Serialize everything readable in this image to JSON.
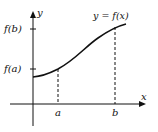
{
  "diagram": {
    "curve_label": "y = f(x)",
    "axes": {
      "x_label": "x",
      "y_label": "y"
    },
    "y_ticks": [
      {
        "label": "f(b)"
      },
      {
        "label": "f(a)"
      }
    ],
    "x_ticks": [
      {
        "label": "a"
      },
      {
        "label": "b"
      }
    ],
    "colors": {
      "ink": "#111111",
      "background": "#ffffff"
    }
  }
}
